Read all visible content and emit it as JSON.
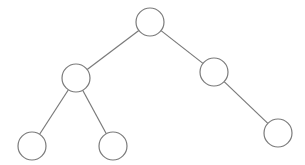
{
  "diagram": {
    "type": "binary-tree",
    "stroke_color": "#7a7a7a",
    "fill_color": "#ffffff",
    "node_radius": 14,
    "nodes": [
      {
        "id": "root",
        "x": 150,
        "y": 22
      },
      {
        "id": "left",
        "x": 76,
        "y": 78
      },
      {
        "id": "right",
        "x": 214,
        "y": 72
      },
      {
        "id": "left-left",
        "x": 32,
        "y": 146
      },
      {
        "id": "left-right",
        "x": 113,
        "y": 146
      },
      {
        "id": "right-right",
        "x": 278,
        "y": 133
      }
    ],
    "edges": [
      {
        "from": "root",
        "to": "left"
      },
      {
        "from": "root",
        "to": "right"
      },
      {
        "from": "left",
        "to": "left-left"
      },
      {
        "from": "left",
        "to": "left-right"
      },
      {
        "from": "right",
        "to": "right-right"
      }
    ]
  }
}
